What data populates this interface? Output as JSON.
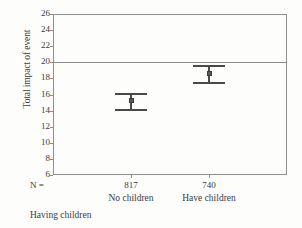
{
  "chart_data": {
    "type": "scatter",
    "title": "",
    "subtitle": "",
    "xlabel": "Having children",
    "ylabel": "Total impact of event",
    "categories": [
      "No children",
      "Have children"
    ],
    "n_label": "N =",
    "n_values": [
      "817",
      "740"
    ],
    "values": [
      15.25,
      18.6
    ],
    "error_low": [
      14.25,
      17.5
    ],
    "error_high": [
      16.15,
      19.7
    ],
    "ylim": [
      6,
      26
    ],
    "ytick_step": 2,
    "yticks": [
      "26",
      "24",
      "22",
      "20",
      "18",
      "16",
      "14",
      "12",
      "10",
      "8",
      "6"
    ],
    "grid": false,
    "legend": "none",
    "reference_line": 20,
    "error_bar_type": "95% CI",
    "colors": {
      "marker": "#5a5a5a",
      "bar": "#4a4a4a",
      "axis": "#8f8f8f",
      "text": "#3a3a3a",
      "background": "#fdfdfc"
    }
  }
}
